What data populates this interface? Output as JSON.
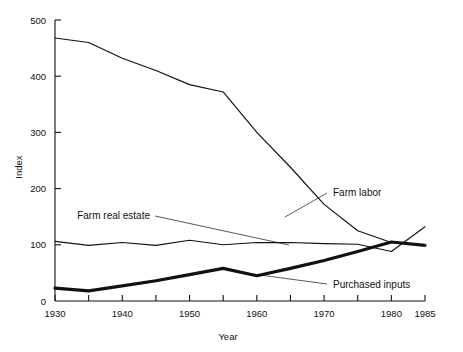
{
  "chart_data": {
    "type": "line",
    "title": "",
    "xlabel": "Year",
    "ylabel": "Index",
    "xlim": [
      1930,
      1985
    ],
    "ylim": [
      0,
      500
    ],
    "grid": false,
    "legend_position": "inline-annotations",
    "x_ticks_major": [
      1930,
      1940,
      1950,
      1960,
      1970,
      1980,
      1985
    ],
    "x_ticks_minor": [
      1935,
      1945,
      1955,
      1965,
      1975
    ],
    "x_tick_labels": [
      "1930",
      "1940",
      "1950",
      "1960",
      "1970",
      "1980",
      "1985"
    ],
    "y_ticks": [
      0,
      100,
      200,
      300,
      400,
      500
    ],
    "y_tick_labels": [
      "0",
      "100",
      "200",
      "300",
      "400",
      "500"
    ],
    "x": [
      1930,
      1935,
      1940,
      1945,
      1950,
      1955,
      1960,
      1965,
      1970,
      1975,
      1980,
      1985
    ],
    "series": [
      {
        "name": "Farm labor",
        "label": "Farm labor",
        "style": "thin",
        "values": [
          468,
          460,
          432,
          410,
          385,
          372,
          300,
          238,
          172,
          125,
          104,
          100
        ]
      },
      {
        "name": "Farm real estate",
        "label": "Farm real estate",
        "style": "thin",
        "values": [
          106,
          99,
          104,
          99,
          108,
          100,
          104,
          104,
          102,
          101,
          88,
          132
        ]
      },
      {
        "name": "Purchased inputs",
        "label": "Purchased inputs",
        "style": "thick",
        "values": [
          23,
          18,
          27,
          36,
          47,
          58,
          45,
          58,
          72,
          88,
          105,
          99
        ]
      }
    ],
    "annotations": [
      {
        "text": "Farm labor",
        "x": 333,
        "y": 196
      },
      {
        "text": "Farm real estate",
        "x": 150,
        "y": 219
      },
      {
        "text": "Purchased inputs",
        "x": 333,
        "y": 288
      }
    ],
    "colors": {
      "line": "#111111",
      "axis": "#111111",
      "background": "#ffffff"
    }
  }
}
